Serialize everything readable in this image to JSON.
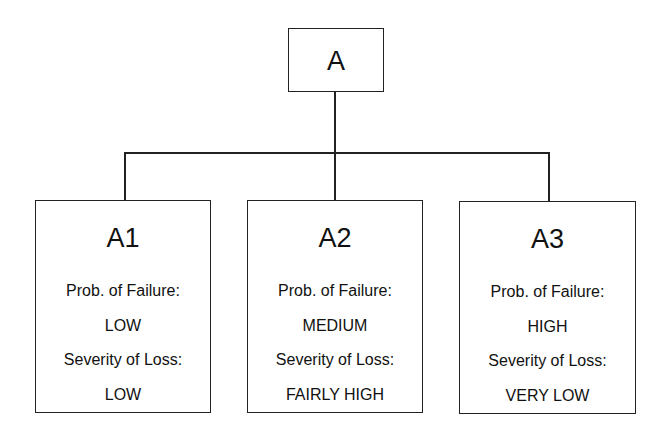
{
  "diagram": {
    "type": "tree",
    "root": {
      "label": "A"
    },
    "children": [
      {
        "label": "A1",
        "prob_label": "Prob. of Failure:",
        "prob_value": "LOW",
        "severity_label": "Severity of Loss:",
        "severity_value": "LOW"
      },
      {
        "label": "A2",
        "prob_label": "Prob. of Failure:",
        "prob_value": "MEDIUM",
        "severity_label": "Severity of Loss:",
        "severity_value": "FAIRLY HIGH"
      },
      {
        "label": "A3",
        "prob_label": "Prob. of Failure:",
        "prob_value": "HIGH",
        "severity_label": "Severity of Loss:",
        "severity_value": "VERY LOW"
      }
    ],
    "edges": [
      {
        "from": "A",
        "to": "A1"
      },
      {
        "from": "A",
        "to": "A2"
      },
      {
        "from": "A",
        "to": "A3"
      }
    ],
    "colors": {
      "line": "#222222",
      "text": "#111111",
      "background": "#ffffff"
    }
  }
}
